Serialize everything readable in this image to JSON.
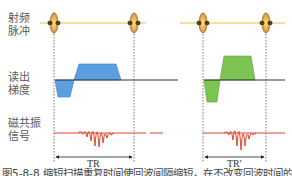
{
  "labels": {
    "rf_pulse": [
      "射频",
      "脉冲"
    ],
    "readout_gradient": [
      "读出",
      "梯度"
    ],
    "mr_signal": [
      "磁共振",
      "信号"
    ]
  },
  "intervals": {
    "left": "TR",
    "right": "TR'"
  },
  "caption": "图5-8-8  缩短扫描重复时间使回波间隔缩短，在不改变回波时间的前提下提高成像速度",
  "colors": {
    "rf_line": "#f2d27a",
    "rf_pulse": "#e8a93a",
    "gradient_left": "#5aa0e0",
    "gradient_right": "#7cc552",
    "signal": "#e0452e",
    "baseline": "#333333"
  }
}
